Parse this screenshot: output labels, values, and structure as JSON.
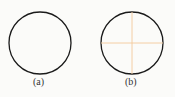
{
  "figures": [
    {
      "id": "a",
      "label": "(a)",
      "cx": 40,
      "cy": 43,
      "r": 31,
      "crosshair": false
    },
    {
      "id": "b",
      "label": "(b)",
      "cx": 132,
      "cy": 43,
      "r": 31,
      "crosshair": true
    }
  ],
  "colors": {
    "circle": "#1a1a1a",
    "crosshair": "#f3c89a",
    "background": "#fbfbf9"
  }
}
